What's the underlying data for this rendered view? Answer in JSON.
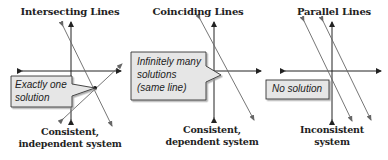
{
  "panels": [
    {
      "id": "intersecting",
      "title": "Intersecting Lines",
      "callout": {
        "lines": [
          "Exactly one",
          "solution"
        ]
      },
      "caption": {
        "line1": "Consistent,",
        "line2": "independent system"
      }
    },
    {
      "id": "coinciding",
      "title": "Coinciding Lines",
      "callout": {
        "lines": [
          "Infinitely many",
          "solutions",
          "(same line)"
        ]
      },
      "caption": {
        "line1": "Consistent,",
        "line2": "dependent system"
      }
    },
    {
      "id": "parallel",
      "title": "Parallel Lines",
      "callout": {
        "lines": [
          "No solution"
        ]
      },
      "caption": {
        "line1": "Inconsistent",
        "line2": "system"
      }
    }
  ],
  "colors": {
    "axis": "#222222",
    "line": "#555555",
    "callout_fill": "#e6e6e6",
    "callout_stroke": "#333333",
    "text": "#222222"
  }
}
